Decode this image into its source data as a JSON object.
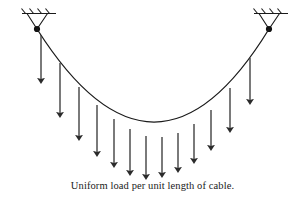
{
  "figure": {
    "caption": "Uniform load per unit length of cable.",
    "background_color": "#ffffff",
    "line_color": "#1a1a1a",
    "arrow_color": "#3a3a3a"
  },
  "supports": [
    {
      "id": "left-support",
      "label": "pin support",
      "anchor_x": 37,
      "anchor_y": 29,
      "ground_y": 13,
      "ground_x_start": 22,
      "ground_x_end": 56,
      "hatch_count": 4
    },
    {
      "id": "right-support",
      "label": "pin support",
      "anchor_x": 269,
      "anchor_y": 29,
      "ground_y": 13,
      "ground_x_start": 254,
      "ground_x_end": 288,
      "hatch_count": 4
    }
  ],
  "cable": {
    "label": "cable",
    "start_x": 37,
    "start_y": 29,
    "end_x": 269,
    "end_y": 29,
    "low_point_x": 155,
    "low_point_y": 138,
    "path": "M 37 29 Q 155 215 269 29"
  },
  "chart_data": {
    "type": "line",
    "title": "Uniform load per unit length of cable",
    "xlabel": "",
    "ylabel": "",
    "grid": false,
    "legend": "none",
    "xlim": [
      0,
      305
    ],
    "ylim": [
      0,
      201
    ],
    "series": [
      {
        "name": "cable",
        "x": [
          37,
          60,
          83,
          106,
          129,
          155,
          178,
          201,
          224,
          247,
          269
        ],
        "y": [
          29,
          63,
          91,
          112,
          128,
          138,
          132,
          117,
          96,
          66,
          29
        ]
      },
      {
        "name": "load-arrow-tips",
        "x": [
          41,
          60,
          79,
          97,
          114,
          130,
          146,
          162,
          178,
          194,
          211,
          230,
          250
        ],
        "y": [
          79,
          113,
          136,
          152,
          163,
          171,
          175,
          173,
          168,
          159,
          146,
          128,
          100
        ]
      }
    ]
  },
  "load_arrows": [
    {
      "id": "load-arrow-1",
      "x": 41,
      "top_y": 35,
      "tip_y": 79
    },
    {
      "id": "load-arrow-2",
      "x": 60,
      "top_y": 63,
      "tip_y": 113
    },
    {
      "id": "load-arrow-3",
      "x": 79,
      "top_y": 87,
      "tip_y": 136
    },
    {
      "id": "load-arrow-4",
      "x": 97,
      "top_y": 105,
      "tip_y": 152
    },
    {
      "id": "load-arrow-5",
      "x": 114,
      "top_y": 119,
      "tip_y": 163
    },
    {
      "id": "load-arrow-6",
      "x": 130,
      "top_y": 129,
      "tip_y": 171
    },
    {
      "id": "load-arrow-7",
      "x": 146,
      "top_y": 136,
      "tip_y": 175
    },
    {
      "id": "load-arrow-8",
      "x": 162,
      "top_y": 137,
      "tip_y": 173
    },
    {
      "id": "load-arrow-9",
      "x": 178,
      "top_y": 133,
      "tip_y": 168
    },
    {
      "id": "load-arrow-10",
      "x": 194,
      "top_y": 124,
      "tip_y": 159
    },
    {
      "id": "load-arrow-11",
      "x": 211,
      "top_y": 110,
      "tip_y": 146
    },
    {
      "id": "load-arrow-12",
      "x": 230,
      "top_y": 88,
      "tip_y": 128
    },
    {
      "id": "load-arrow-13",
      "x": 250,
      "top_y": 58,
      "tip_y": 100
    }
  ]
}
